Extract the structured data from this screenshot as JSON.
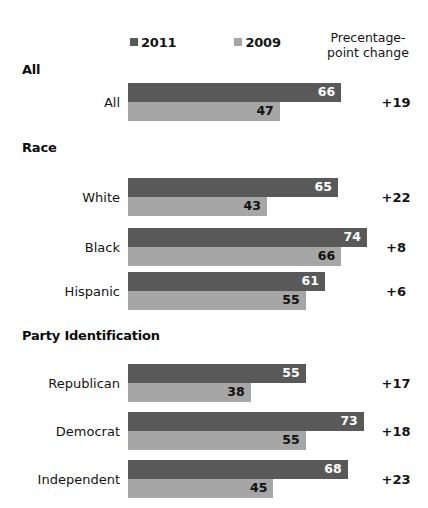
{
  "chart_data": {
    "type": "bar",
    "orientation": "horizontal",
    "title": "",
    "xlabel": "",
    "ylabel": "",
    "xlim": [
      0,
      74
    ],
    "grid": false,
    "legend_position": "top",
    "legend": [
      {
        "label": "2011",
        "color": "#595959",
        "swatch": "square-swatch"
      },
      {
        "label": "2009",
        "color": "#a6a6a6",
        "swatch": "square-swatch"
      }
    ],
    "series": [
      {
        "name": "2011",
        "values": [
          66,
          65,
          74,
          61,
          55,
          73,
          68
        ]
      },
      {
        "name": "2009",
        "values": [
          47,
          43,
          66,
          55,
          38,
          55,
          45
        ]
      }
    ],
    "categories": [
      "All",
      "White",
      "Black",
      "Hispanic",
      "Republican",
      "Democrat",
      "Independent"
    ],
    "change_column_header": "Precentage-point change",
    "change_values": [
      "+19",
      "+22",
      "+8",
      "+6",
      "+17",
      "+18",
      "+23"
    ]
  },
  "legend": {
    "entries": [
      {
        "label": "2011"
      },
      {
        "label": "2009"
      }
    ]
  },
  "header": {
    "change_line1": "Precentage-",
    "change_line2": "point change"
  },
  "sections": [
    {
      "id": "all",
      "title": "All"
    },
    {
      "id": "race",
      "title": "Race"
    },
    {
      "id": "party",
      "title": "Party Identification"
    }
  ],
  "rows": [
    {
      "label": "All",
      "v2011": 66,
      "v2009": 47,
      "change": "+19"
    },
    {
      "label": "White",
      "v2011": 65,
      "v2009": 43,
      "change": "+22"
    },
    {
      "label": "Black",
      "v2011": 74,
      "v2009": 66,
      "change": "+8"
    },
    {
      "label": "Hispanic",
      "v2011": 61,
      "v2009": 55,
      "change": "+6"
    },
    {
      "label": "Republican",
      "v2011": 55,
      "v2009": 38,
      "change": "+17"
    },
    {
      "label": "Democrat",
      "v2011": 73,
      "v2009": 55,
      "change": "+18"
    },
    {
      "label": "Independent",
      "v2011": 68,
      "v2009": 45,
      "change": "+23"
    }
  ],
  "colors": {
    "bar_2011": "#595959",
    "bar_2009": "#a6a6a6",
    "background": "#ffffff",
    "text": "#141414"
  },
  "layout": {
    "bar_origin_x": 128,
    "px_per_unit": 3.23,
    "section_header_tops": [
      62,
      140,
      328
    ],
    "row_tops": [
      83,
      178,
      228,
      272,
      364,
      412,
      460
    ]
  }
}
